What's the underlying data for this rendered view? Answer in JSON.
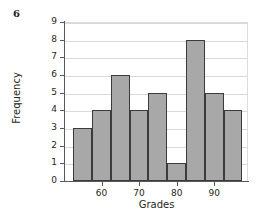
{
  "problem": {
    "number": "6"
  },
  "chart_data": {
    "type": "bar",
    "title": "",
    "xlabel": "Grades",
    "ylabel": "Frequency",
    "categories": [
      "52.5-57.5",
      "57.5-62.5",
      "62.5-67.5",
      "67.5-72.5",
      "72.5-77.5",
      "77.5-82.5",
      "82.5-87.5",
      "87.5-92.5",
      "92.5-97.5"
    ],
    "bin_edges": [
      52.5,
      57.5,
      62.5,
      67.5,
      72.5,
      77.5,
      82.5,
      87.5,
      92.5,
      97.5
    ],
    "values": [
      3,
      4,
      6,
      4,
      5,
      1,
      8,
      5,
      4
    ],
    "xlim": [
      50,
      99
    ],
    "ylim": [
      0,
      9
    ],
    "ytick_labels": [
      "0",
      "1",
      "2",
      "3",
      "4",
      "5",
      "6",
      "7",
      "8",
      "9"
    ],
    "ytick_values": [
      0,
      1,
      2,
      3,
      4,
      5,
      6,
      7,
      8,
      9
    ],
    "xtick_labels": [
      "60",
      "70",
      "80",
      "90"
    ],
    "xtick_values": [
      60,
      70,
      80,
      90
    ],
    "grid": true,
    "grid_axis": "y",
    "legend": false,
    "bar_fill_color": "#a8a8a8",
    "bar_edge_color": "#3b3b3b",
    "gridline_color": "#d9d9d9",
    "axis_color": "#58595b",
    "background_color": "#ffffff"
  }
}
